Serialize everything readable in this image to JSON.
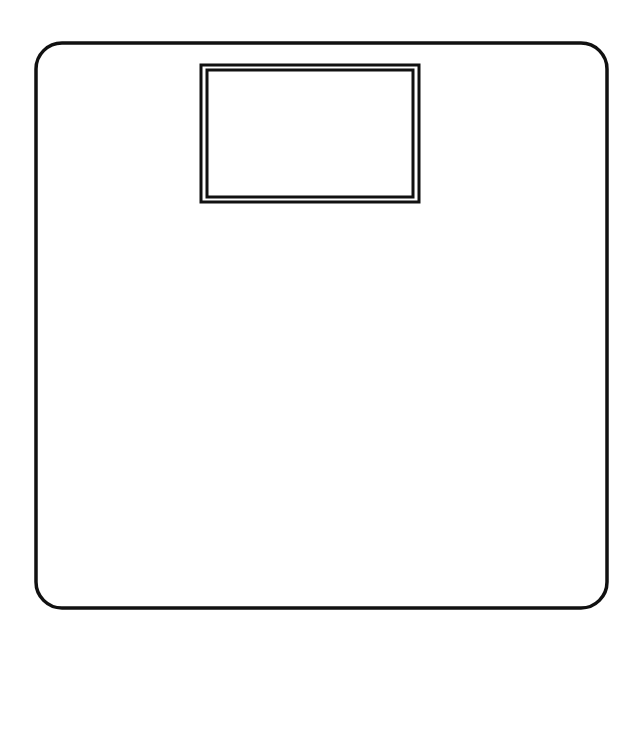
{
  "drawing": {
    "subject": "bathroom scale",
    "stroke_color": "#111111",
    "background_color": "#ffffff",
    "body": {
      "x": 36,
      "y": 43,
      "width": 571,
      "height": 565,
      "corner_radius": 26,
      "stroke_width": 3.5
    },
    "display_outer": {
      "x": 201,
      "y": 65,
      "width": 218,
      "height": 137,
      "stroke_width": 3
    },
    "display_inner": {
      "x": 207,
      "y": 70,
      "width": 206,
      "height": 127,
      "stroke_width": 3
    }
  }
}
